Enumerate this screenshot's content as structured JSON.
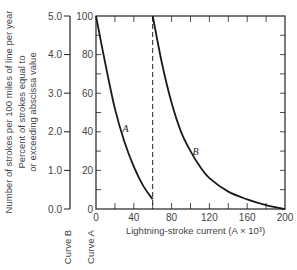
{
  "chart_data": {
    "type": "line",
    "title": "",
    "xlabel": "Lightning-stroke current (A × 10³)",
    "ylabel_outer": "Number of strokes per 100 miles of line per year",
    "ylabel_inner": "Percent of strokes equal to or exceeding abscissa value",
    "xlim": [
      0,
      200
    ],
    "ylim_inner": [
      0,
      100
    ],
    "ylim_outer": [
      0.0,
      5.0
    ],
    "x_ticks": [
      0,
      40,
      80,
      120,
      160,
      200
    ],
    "x_tick_labels": [
      "0",
      "40",
      "80",
      "120",
      "160",
      "200"
    ],
    "y_inner_ticks": [
      0,
      20,
      40,
      60,
      80,
      100
    ],
    "y_inner_tick_labels": [
      "0",
      "20",
      "40",
      "60",
      "80",
      "100"
    ],
    "y_outer_ticks": [
      0.0,
      1.0,
      2.0,
      3.0,
      4.0,
      5.0
    ],
    "y_outer_tick_labels": [
      "0.0",
      "1.0",
      "2.0",
      "3.0",
      "4.0",
      "5.0"
    ],
    "grid": false,
    "dashed_line_x": 60,
    "series": [
      {
        "name": "A",
        "x": [
          0,
          10,
          20,
          30,
          40,
          50,
          60
        ],
        "values": [
          100,
          75,
          52,
          35,
          22,
          12,
          5
        ]
      },
      {
        "name": "B",
        "x": [
          60,
          70,
          80,
          90,
          100,
          110,
          120,
          140,
          160,
          180,
          200
        ],
        "values": [
          100,
          75,
          55,
          40,
          30,
          22,
          16,
          9,
          5,
          2,
          0
        ]
      }
    ],
    "axis_captions": {
      "curve_b": "Curve B",
      "curve_a": "Curve A"
    }
  }
}
